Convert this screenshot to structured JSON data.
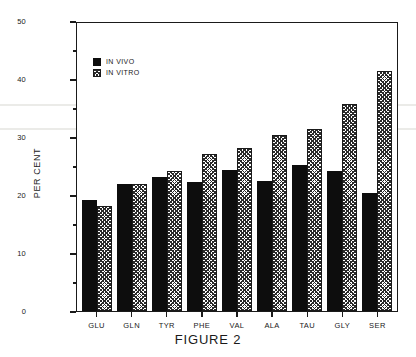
{
  "caption": "FIGURE 2",
  "legend": {
    "position": "top-left-inside",
    "entries": [
      {
        "label": "IN VIVO",
        "swatch": "solid-black-square-icon"
      },
      {
        "label": "IN VITRO",
        "swatch": "hatched-square-icon"
      }
    ]
  },
  "axes": {
    "y_title": "PER CENT",
    "y_ticks": [
      "0",
      "10",
      "20",
      "30",
      "40",
      "50"
    ],
    "y_minor_count_between": 1
  },
  "colors": {
    "in_vivo": "#0d0d0d",
    "in_vitro_hatch": "#2a2a2a",
    "axis": "#1a1a1a",
    "background": "#ffffff"
  },
  "chart_data": {
    "type": "bar",
    "title": "FIGURE 2",
    "xlabel": "",
    "ylabel": "PER CENT",
    "ylim": [
      0,
      50
    ],
    "yticks": [
      0,
      10,
      20,
      30,
      40,
      50
    ],
    "grid": false,
    "legend_position": "upper left",
    "categories": [
      "GLU",
      "GLN",
      "TYR",
      "PHE",
      "VAL",
      "ALA",
      "TAU",
      "GLY",
      "SER"
    ],
    "series": [
      {
        "name": "IN VIVO",
        "values": [
          19.1,
          21.9,
          23.1,
          22.2,
          24.3,
          22.4,
          25.2,
          24.1,
          20.3
        ]
      },
      {
        "name": "IN VITRO",
        "values": [
          18.1,
          21.9,
          24.1,
          27.1,
          28.1,
          30.3,
          31.4,
          35.7,
          41.4
        ]
      }
    ]
  }
}
